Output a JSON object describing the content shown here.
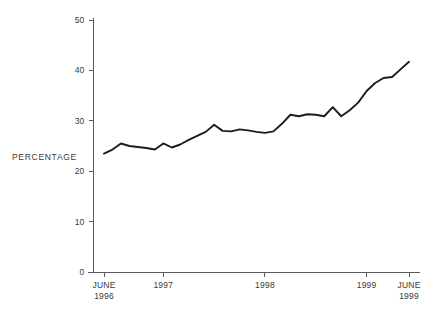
{
  "chart_data": {
    "type": "line",
    "title": "",
    "subtitle": "",
    "xlabel": "",
    "ylabel": "PERCENTAGE",
    "ylim": [
      0,
      50
    ],
    "yticks": [
      0,
      10,
      20,
      30,
      40,
      50
    ],
    "ytick_labels": [
      "0",
      "10",
      "20",
      "30",
      "40",
      "50"
    ],
    "xtick_labels": [
      "JUNE\n1996",
      "1997",
      "1998",
      "1999",
      "JUNE\n1999"
    ],
    "xticks": [
      {
        "label_line1": "JUNE",
        "label_line2": "1996",
        "value": "1996-06"
      },
      {
        "label_line1": "1997",
        "label_line2": "",
        "value": "1997-01"
      },
      {
        "label_line1": "1998",
        "label_line2": "",
        "value": "1998-01"
      },
      {
        "label_line1": "1999",
        "label_line2": "",
        "value": "1999-01"
      },
      {
        "label_line1": "JUNE",
        "label_line2": "1999",
        "value": "1999-06"
      }
    ],
    "grid": false,
    "legend": null,
    "line_color": "#1c1c1c",
    "axis_color": "#5a5a5a",
    "x": [
      "1996-06",
      "1996-07",
      "1996-08",
      "1996-09",
      "1996-10",
      "1996-11",
      "1996-12",
      "1997-01",
      "1997-02",
      "1997-03",
      "1997-04",
      "1997-05",
      "1997-06",
      "1997-07",
      "1997-08",
      "1997-09",
      "1997-10",
      "1997-11",
      "1997-12",
      "1998-01",
      "1998-02",
      "1998-03",
      "1998-04",
      "1998-05",
      "1998-06",
      "1998-07",
      "1998-08",
      "1998-09",
      "1998-10",
      "1998-11",
      "1998-12",
      "1999-01",
      "1999-02",
      "1999-03",
      "1999-04",
      "1999-05",
      "1999-06"
    ],
    "values": [
      23.5,
      24.3,
      25.5,
      25.0,
      24.8,
      24.6,
      24.3,
      25.5,
      24.7,
      25.3,
      26.2,
      27.0,
      27.8,
      29.2,
      28.0,
      27.9,
      28.3,
      28.1,
      27.8,
      27.6,
      27.9,
      29.4,
      31.2,
      30.9,
      31.3,
      31.2,
      30.9,
      32.7,
      30.9,
      32.1,
      33.6,
      35.9,
      37.5,
      38.5,
      38.7,
      40.2,
      41.7
    ],
    "series_name": "Percentage"
  },
  "figure": {
    "background_color": "#ffffff"
  }
}
